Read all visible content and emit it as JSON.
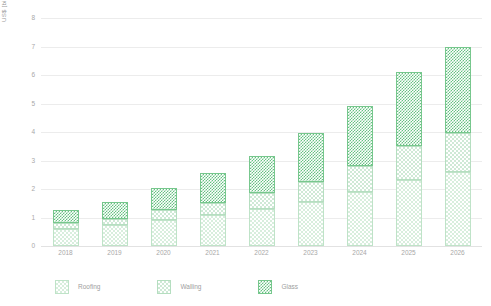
{
  "chart_data": {
    "type": "bar",
    "stacked": true,
    "title": "",
    "subtitle": "",
    "xlabel": "",
    "ylabel": "US$ [billion]",
    "categories": [
      "2018",
      "2019",
      "2020",
      "2021",
      "2022",
      "2023",
      "2024",
      "2025",
      "2026"
    ],
    "series": [
      {
        "name": "Roofing",
        "color": "#d8eedd",
        "values": [
          0.6,
          0.75,
          0.9,
          1.1,
          1.3,
          1.55,
          1.9,
          2.3,
          2.6
        ]
      },
      {
        "name": "Walling",
        "color": "#cfe9d6",
        "values": [
          0.2,
          0.2,
          0.35,
          0.4,
          0.55,
          0.7,
          0.9,
          1.2,
          1.35
        ]
      },
      {
        "name": "Glass",
        "color": "#66c182",
        "values": [
          0.45,
          0.6,
          0.8,
          1.05,
          1.3,
          1.7,
          2.1,
          2.6,
          3.05
        ]
      }
    ],
    "totals": [
      1.25,
      1.55,
      2.05,
      2.55,
      3.15,
      3.95,
      4.9,
      6.1,
      7.0
    ],
    "ylim": [
      0,
      8
    ],
    "yticks": [
      "0",
      "1",
      "2",
      "3",
      "4",
      "5",
      "6",
      "7",
      "8"
    ],
    "ytick_values": [
      0,
      1,
      2,
      3,
      4,
      5,
      6,
      7,
      8
    ],
    "grid": true,
    "legend_position": "bottom-left",
    "legend": [
      "Roofing",
      "Walling",
      "Glass"
    ]
  },
  "axis": {
    "y_title": "US$ [billion]"
  },
  "colors": {
    "grid": "#ececec",
    "tick_text": "#a8a8a8",
    "legend_text": "#9e9e9e",
    "background": "#ffffff"
  }
}
